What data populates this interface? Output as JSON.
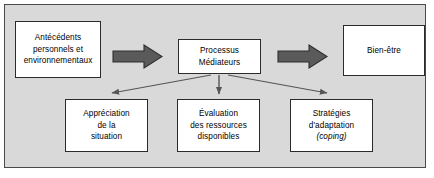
{
  "diagram": {
    "background_color": "#d9d9d9",
    "box_fill_color": "#ffffff",
    "box_border_color": "#2b2b2b",
    "block_arrow_color": "#5a5a5a",
    "thin_arrow_color": "#555555",
    "nodes": {
      "antecedents": {
        "lines": [
          "Antécédents",
          "personnels et",
          "environnementaux"
        ]
      },
      "processus": {
        "lines": [
          "Processus",
          "Médiateurs"
        ]
      },
      "bienetre": {
        "lines": [
          "Bien-être"
        ]
      },
      "appreciation": {
        "lines": [
          "Appréciation",
          "de la",
          "situation"
        ]
      },
      "evaluation": {
        "lines": [
          "Évaluation",
          "des ressources",
          "disponibles"
        ]
      },
      "strategies": {
        "lines": [
          "Stratégies",
          "d'adaptation",
          "(coping)"
        ]
      }
    },
    "connectors": [
      {
        "name": "block-arrow-antecedents-to-processus",
        "style": "block",
        "direction": "right"
      },
      {
        "name": "block-arrow-processus-to-bienetre",
        "style": "block",
        "direction": "right"
      },
      {
        "name": "thin-arrow-processus-to-appreciation",
        "style": "thin",
        "direction": "down-left"
      },
      {
        "name": "thin-arrow-processus-to-evaluation",
        "style": "thin",
        "direction": "down"
      },
      {
        "name": "thin-arrow-processus-to-strategies",
        "style": "thin",
        "direction": "down-right"
      }
    ]
  }
}
